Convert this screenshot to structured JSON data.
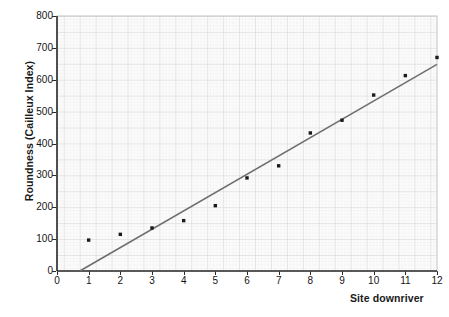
{
  "chart_data": {
    "type": "scatter",
    "title": "",
    "xlabel": "Site downriver",
    "ylabel": "Roundness (Cailleux Index)",
    "xlim": [
      0,
      12
    ],
    "ylim": [
      0,
      800
    ],
    "x_ticks": [
      0,
      1,
      2,
      3,
      4,
      5,
      6,
      7,
      8,
      9,
      10,
      11,
      12
    ],
    "y_ticks": [
      0,
      100,
      200,
      300,
      400,
      500,
      600,
      700,
      800
    ],
    "grid": true,
    "grid_style": "graph-paper-minor-and-major",
    "legend": "none",
    "x": [
      1,
      2,
      3,
      4,
      5,
      6,
      7,
      8,
      9,
      10,
      11,
      12
    ],
    "values": [
      97,
      115,
      135,
      158,
      205,
      292,
      330,
      433,
      473,
      552,
      613,
      670
    ],
    "series": [
      {
        "name": "Roundness (Cailleux Index)",
        "marker": "filled-square-dot",
        "color": "#1b1b1b",
        "values": [
          97,
          115,
          135,
          158,
          205,
          292,
          330,
          433,
          473,
          552,
          613,
          670
        ]
      }
    ],
    "trendline": {
      "type": "linear-best-fit",
      "color": "#6e6e6e",
      "x_start": 0.72,
      "y_start": 0,
      "x_end": 12,
      "y_end": 648
    },
    "point_labels": [
      {
        "site": 1,
        "roundness": 97
      },
      {
        "site": 2,
        "roundness": 115
      },
      {
        "site": 3,
        "roundness": 135
      },
      {
        "site": 4,
        "roundness": 158
      },
      {
        "site": 5,
        "roundness": 205
      },
      {
        "site": 6,
        "roundness": 292
      },
      {
        "site": 7,
        "roundness": 330
      },
      {
        "site": 8,
        "roundness": 433
      },
      {
        "site": 9,
        "roundness": 473
      },
      {
        "site": 10,
        "roundness": 552
      },
      {
        "site": 11,
        "roundness": 613
      },
      {
        "site": 12,
        "roundness": 670
      }
    ],
    "colors": {
      "point": "#1b1b1b",
      "trendline": "#6e6e6e",
      "axis": "#2b2b2b",
      "grid_minor": "#e8e8e8",
      "grid_major": "#d2d2d2",
      "plot_background": "#fcfcfc",
      "text": "#141414"
    }
  },
  "axis_labels": {
    "y_title": "Roundness (Cailleux Index)",
    "x_title": "Site downriver"
  }
}
